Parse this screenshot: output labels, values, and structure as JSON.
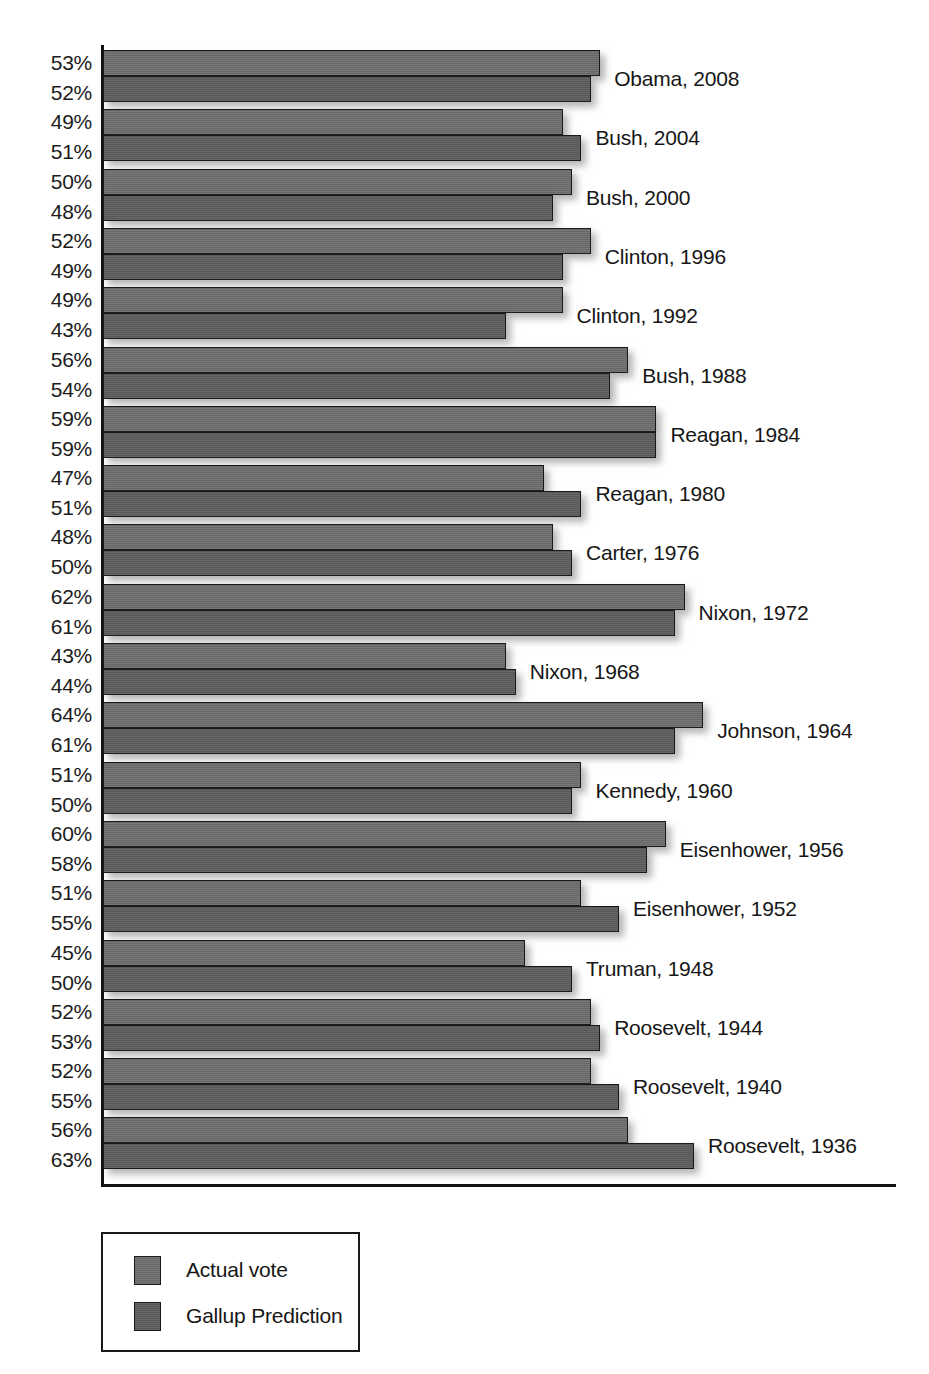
{
  "chart_data": {
    "type": "bar",
    "orientation": "horizontal",
    "title": "",
    "subtitle": "",
    "xlabel": "",
    "ylabel": "",
    "grid": false,
    "xlim": [
      0,
      70
    ],
    "legend_position": "bottom-left",
    "value_suffix": "%",
    "categories": [
      "Obama, 2008",
      "Bush, 2004",
      "Bush, 2000",
      "Clinton, 1996",
      "Clinton, 1992",
      "Bush, 1988",
      "Reagan, 1984",
      "Reagan, 1980",
      "Carter, 1976",
      "Nixon, 1972",
      "Nixon, 1968",
      "Johnson, 1964",
      "Kennedy, 1960",
      "Eisenhower, 1956",
      "Eisenhower, 1952",
      "Truman, 1948",
      "Roosevelt, 1944",
      "Roosevelt, 1940",
      "Roosevelt, 1936"
    ],
    "series": [
      {
        "name": "Actual vote",
        "values": [
          53,
          49,
          50,
          52,
          49,
          56,
          59,
          47,
          48,
          62,
          43,
          64,
          51,
          60,
          51,
          45,
          52,
          52,
          56
        ]
      },
      {
        "name": "Gallup Prediction",
        "values": [
          52,
          51,
          48,
          49,
          43,
          54,
          59,
          51,
          50,
          61,
          44,
          61,
          50,
          58,
          55,
          50,
          53,
          55,
          63
        ]
      }
    ],
    "value_labels": [
      {
        "actual": "53%",
        "gallup": "52%"
      },
      {
        "actual": "49%",
        "gallup": "51%"
      },
      {
        "actual": "50%",
        "gallup": "48%"
      },
      {
        "actual": "52%",
        "gallup": "49%"
      },
      {
        "actual": "49%",
        "gallup": "43%"
      },
      {
        "actual": "56%",
        "gallup": "54%"
      },
      {
        "actual": "59%",
        "gallup": "59%"
      },
      {
        "actual": "47%",
        "gallup": "51%"
      },
      {
        "actual": "48%",
        "gallup": "50%"
      },
      {
        "actual": "62%",
        "gallup": "61%"
      },
      {
        "actual": "43%",
        "gallup": "44%"
      },
      {
        "actual": "64%",
        "gallup": "61%"
      },
      {
        "actual": "51%",
        "gallup": "50%"
      },
      {
        "actual": "60%",
        "gallup": "58%"
      },
      {
        "actual": "51%",
        "gallup": "55%"
      },
      {
        "actual": "45%",
        "gallup": "50%"
      },
      {
        "actual": "52%",
        "gallup": "53%"
      },
      {
        "actual": "52%",
        "gallup": "55%"
      },
      {
        "actual": "56%",
        "gallup": "63%"
      }
    ]
  },
  "legend": {
    "items": [
      {
        "label": "Actual vote",
        "color": "#6d6d6d"
      },
      {
        "label": "Gallup Prediction",
        "color": "#5e5e5e"
      }
    ]
  },
  "colors": {
    "actual": "#6d6d6d",
    "gallup": "#5e5e5e",
    "axis": "#111111",
    "text": "#1a1a1a",
    "background": "#ffffff"
  }
}
